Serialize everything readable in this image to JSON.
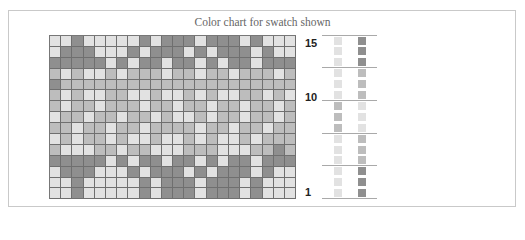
{
  "chart_data": {
    "type": "heatmap",
    "title": "Color chart for swatch shown",
    "rows": 15,
    "columns": 22,
    "row_labels": [
      {
        "row": 15,
        "label": "15"
      },
      {
        "row": 10,
        "label": "10"
      },
      {
        "row": 1,
        "label": "1"
      }
    ],
    "palette": {
      "L": "#e2e2e2",
      "M": "#bdbdbd",
      "D": "#8f8f8f"
    },
    "grid_top_to_bottom": [
      "LLDLLLLLDLDDDLDDDLDLLL",
      "LDDDLLLDLDDDLDLDDDLDLL",
      "DDDDDLDLDDLDDLDLDDLDDD",
      "MLMLLMLMMMLMMLMMLMMMLM",
      "DMMMMMMMMMMMMMMMMMMMMM",
      "MLMLLMMLLMLLMLMLLMMLML",
      "MLMMLMMMLMMLMMLMMLMMLM",
      "LMMLMMLMMLMLLMLMMLMMLM",
      "MMLMMLMMLMMMMLMMLMMLMM",
      "LMLMMLMLLMLLMLMLLMLMMM",
      "MLLLMMLMMLLLMMMLLLMMDM",
      "DDDDDLDLDDLDDLDLDDLDDD",
      "LDDDLLLDLDDDLDLDDDLDLL",
      "LLDLLLLLDLDDDLDDDLDLLL",
      "LLDLLLLLDLDDDLDDDLDLLL"
    ],
    "legend_top_to_bottom": [
      {
        "row": 15,
        "left": "L",
        "right": "D"
      },
      {
        "row": 14,
        "left": "L",
        "right": "D"
      },
      {
        "row": 13,
        "left": "L",
        "right": "D"
      },
      {
        "row": 12,
        "left": "L",
        "right": "M"
      },
      {
        "row": 11,
        "left": "L",
        "right": "M"
      },
      {
        "row": 10,
        "left": "L",
        "right": "M"
      },
      {
        "row": 9,
        "left": "M",
        "right": "L"
      },
      {
        "row": 8,
        "left": "M",
        "right": "L"
      },
      {
        "row": 7,
        "left": "M",
        "right": "L"
      },
      {
        "row": 6,
        "left": "L",
        "right": "M"
      },
      {
        "row": 5,
        "left": "L",
        "right": "M"
      },
      {
        "row": 4,
        "left": "L",
        "right": "M"
      },
      {
        "row": 3,
        "left": "L",
        "right": "D"
      },
      {
        "row": 2,
        "left": "L",
        "right": "D"
      },
      {
        "row": 1,
        "left": "L",
        "right": "D"
      }
    ]
  },
  "labels": {
    "title": "Color chart for swatch shown",
    "row15": "15",
    "row10": "10",
    "row1": "1"
  }
}
